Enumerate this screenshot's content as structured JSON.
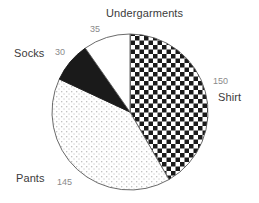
{
  "chart_data": {
    "type": "pie",
    "title": "",
    "xlabel": "",
    "ylabel": "",
    "grid": false,
    "legend": "none",
    "labels_position": "outside",
    "total": 360,
    "start_angle_deg": 0,
    "direction": "clockwise",
    "categories": [
      "Shirt",
      "Pants",
      "Socks",
      "Undergarments"
    ],
    "values": [
      150,
      145,
      30,
      35
    ],
    "slices": [
      {
        "label": "Shirt",
        "value": 150,
        "value_text": "150",
        "fill": "checkerboard",
        "color": "#1a1a1a",
        "start_deg": 0,
        "end_deg": 150
      },
      {
        "label": "Pants",
        "value": 145,
        "value_text": "145",
        "fill": "stipple-dots",
        "color": "#c9c9c9",
        "start_deg": 150,
        "end_deg": 295
      },
      {
        "label": "Socks",
        "value": 30,
        "value_text": "30",
        "fill": "solid",
        "color": "#1a1a1a",
        "start_deg": 295,
        "end_deg": 325
      },
      {
        "label": "Undergarments",
        "value": 35,
        "value_text": "35",
        "fill": "none",
        "color": "#ffffff",
        "start_deg": 325,
        "end_deg": 360
      }
    ]
  },
  "style": {
    "background": "#ffffff",
    "outline": "#5a5a5a",
    "label_color": "#3b3b3b",
    "value_color": "#8a8a8a"
  }
}
